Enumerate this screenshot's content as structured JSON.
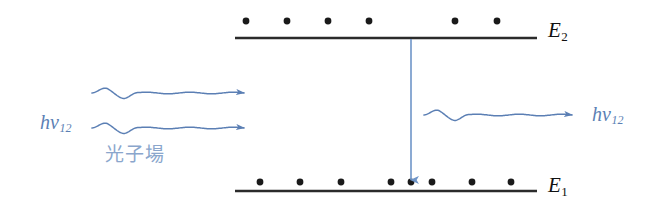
{
  "diagram": {
    "colors": {
      "level_line": "#2b2b2b",
      "electron_dot": "#1a1a1a",
      "photon_blue": "#5b7fb4",
      "field_text": "#8aa6cc",
      "transition_arrow": "#6f95c8",
      "background": "#ffffff"
    },
    "levels": [
      {
        "name": "upper-level",
        "label_text": "E",
        "label_sub": "2",
        "label_x": 548,
        "label_y": 20,
        "line": {
          "x1": 235,
          "y1": 38,
          "x2": 537,
          "y2": 38,
          "width": 2.6
        },
        "electrons": [
          {
            "cx": 246,
            "cy": 21
          },
          {
            "cx": 287,
            "cy": 21
          },
          {
            "cx": 328,
            "cy": 21
          },
          {
            "cx": 369,
            "cy": 21
          },
          {
            "cx": 455,
            "cy": 21
          },
          {
            "cx": 497,
            "cy": 21
          }
        ],
        "electron_count": 6
      },
      {
        "name": "lower-level",
        "label_text": "E",
        "label_sub": "1",
        "label_x": 548,
        "label_y": 175,
        "line": {
          "x1": 235,
          "y1": 191,
          "x2": 537,
          "y2": 191,
          "width": 2.6
        },
        "electrons": [
          {
            "cx": 260,
            "cy": 182
          },
          {
            "cx": 300,
            "cy": 182
          },
          {
            "cx": 341,
            "cy": 182
          },
          {
            "cx": 391,
            "cy": 182
          },
          {
            "cx": 411,
            "cy": 182
          },
          {
            "cx": 432,
            "cy": 182
          },
          {
            "cx": 472,
            "cy": 182
          },
          {
            "cx": 511,
            "cy": 182
          }
        ],
        "electron_count": 8
      }
    ],
    "transition": {
      "name": "downward-transition-arrow",
      "x": 411,
      "y_start": 39,
      "y_end": 184,
      "stroke_width": 1.6,
      "direction": "downward"
    },
    "incident_waves": [
      {
        "name": "incident-photon-wave-upper",
        "x_start": 92,
        "x_end": 244,
        "y": 93,
        "amplitude": 5.5,
        "cycles": 3.5,
        "arrow": "right"
      },
      {
        "name": "incident-photon-wave-lower",
        "x_start": 92,
        "x_end": 244,
        "y": 128,
        "amplitude": 5.5,
        "cycles": 3.5,
        "arrow": "right"
      }
    ],
    "emitted_wave": {
      "name": "emitted-photon-wave",
      "x_start": 424,
      "x_end": 572,
      "y": 115,
      "amplitude": 5.5,
      "cycles": 3.5,
      "arrow": "right"
    },
    "labels": {
      "incident_photon": {
        "text": "hv",
        "sub": "12",
        "x": 40,
        "y": 112
      },
      "emitted_photon": {
        "text": "hv",
        "sub": "12",
        "x": 592,
        "y": 104
      },
      "photon_field": {
        "text": "光子場",
        "x": 105,
        "y": 145
      }
    }
  }
}
